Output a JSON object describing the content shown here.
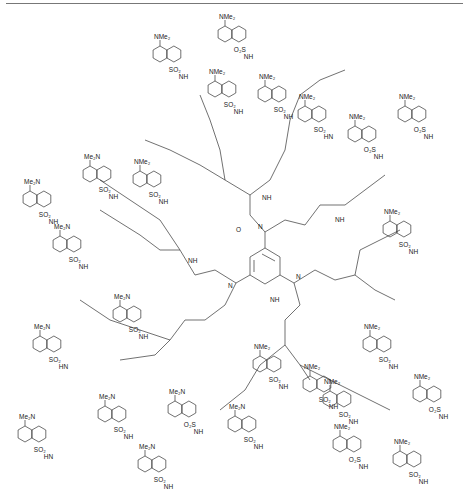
{
  "figure": {
    "caption": "",
    "core": {
      "label_amide_O": "O",
      "label_N": "N",
      "label_NH": "NH"
    },
    "dansyl": {
      "amine_label": "NMe2",
      "amine_label_rev": "Me2N",
      "sulfonyl_label": "SO2",
      "sulfonyl_label_rev": "O2S",
      "nh_label": "NH",
      "hn_label": "HN"
    },
    "units": [
      {
        "x": 225,
        "y": 20,
        "amine": "NMe2",
        "sulf": "O2S",
        "nh": "NH"
      },
      {
        "x": 160,
        "y": 40,
        "amine": "NMe2",
        "sulf": "SO2",
        "nh": "NH"
      },
      {
        "x": 265,
        "y": 80,
        "amine": "NMe2",
        "sulf": "SO2",
        "nh": "NH"
      },
      {
        "x": 215,
        "y": 75,
        "amine": "NMe2",
        "sulf": "SO2",
        "nh": "NH"
      },
      {
        "x": 305,
        "y": 100,
        "amine": "NMe2",
        "sulf": "SO2",
        "nh": "HN"
      },
      {
        "x": 355,
        "y": 120,
        "amine": "NMe2",
        "sulf": "O2S",
        "nh": "NH"
      },
      {
        "x": 405,
        "y": 100,
        "amine": "NMe2",
        "sulf": "O2S",
        "nh": "NH"
      },
      {
        "x": 90,
        "y": 160,
        "amine": "Me2N",
        "sulf": "SO2",
        "nh": "NH"
      },
      {
        "x": 140,
        "y": 165,
        "amine": "NMe2",
        "sulf": "SO2",
        "nh": "NH"
      },
      {
        "x": 30,
        "y": 185,
        "amine": "Me2N",
        "sulf": "SO2",
        "nh": "NH"
      },
      {
        "x": 60,
        "y": 230,
        "amine": "Me2N",
        "sulf": "SO2",
        "nh": "NH"
      },
      {
        "x": 390,
        "y": 215,
        "amine": "NMe2",
        "sulf": "SO2",
        "nh": "NH"
      },
      {
        "x": 120,
        "y": 300,
        "amine": "Me2N",
        "sulf": "SO2",
        "nh": "NH"
      },
      {
        "x": 40,
        "y": 330,
        "amine": "Me2N",
        "sulf": "SO2",
        "nh": "HN"
      },
      {
        "x": 370,
        "y": 330,
        "amine": "NMe2",
        "sulf": "SO2",
        "nh": "NH"
      },
      {
        "x": 420,
        "y": 380,
        "amine": "NMe2",
        "sulf": "O2S",
        "nh": "NH"
      },
      {
        "x": 310,
        "y": 370,
        "amine": "NMe2",
        "sulf": "SO2",
        "nh": "NH"
      },
      {
        "x": 25,
        "y": 420,
        "amine": "Me2N",
        "sulf": "SO2",
        "nh": "HN"
      },
      {
        "x": 105,
        "y": 400,
        "amine": "Me2N",
        "sulf": "SO2",
        "nh": "NH"
      },
      {
        "x": 175,
        "y": 395,
        "amine": "Me2N",
        "sulf": "O2S",
        "nh": "NH"
      },
      {
        "x": 235,
        "y": 410,
        "amine": "Me2N",
        "sulf": "SO2",
        "nh": "NH"
      },
      {
        "x": 145,
        "y": 450,
        "amine": "Me2N",
        "sulf": "SO2",
        "nh": "NH"
      },
      {
        "x": 340,
        "y": 430,
        "amine": "NMe2",
        "sulf": "O2S",
        "nh": "NH"
      },
      {
        "x": 400,
        "y": 445,
        "amine": "NMe2",
        "sulf": "SO2",
        "nh": "NH"
      },
      {
        "x": 330,
        "y": 385,
        "amine": "NMe2",
        "sulf": "SO2",
        "nh": "NH"
      },
      {
        "x": 260,
        "y": 350,
        "amine": "NMe2",
        "sulf": "SO2",
        "nh": "NH"
      }
    ]
  }
}
